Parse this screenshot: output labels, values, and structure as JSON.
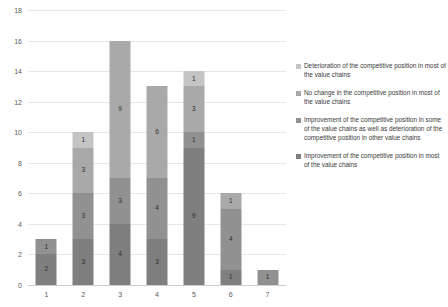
{
  "chart_data": {
    "type": "bar",
    "stacked": true,
    "title": "",
    "subtitle": "",
    "xlabel": "",
    "ylabel": "",
    "categories": [
      "1",
      "2",
      "3",
      "4",
      "5",
      "6",
      "7"
    ],
    "ylim": [
      0,
      18
    ],
    "ytick_values": [
      0,
      2,
      4,
      6,
      8,
      10,
      12,
      14,
      16,
      18
    ],
    "ytick_labels": [
      "0",
      "2",
      "4",
      "6",
      "8",
      "10",
      "12",
      "14",
      "16",
      "18"
    ],
    "grid": true,
    "grid_axis": "y",
    "legend_position": "right",
    "series": [
      {
        "name": "Improvement of the competitive position in most of the value chains",
        "color": "#7f7f7f",
        "values": [
          2,
          3,
          4,
          3,
          9,
          1,
          0
        ]
      },
      {
        "name": "Improvement of the competitive position in some of the value chains as well as deterioration of the competitive position in other value chains",
        "color": "#919191",
        "values": [
          1,
          3,
          3,
          4,
          1,
          4,
          1
        ]
      },
      {
        "name": "No change in the competitive position in most of the value chains",
        "color": "#a9a9a9",
        "values": [
          0,
          3,
          9,
          6,
          3,
          1,
          0
        ]
      },
      {
        "name": "Deterioration of the competitive position in most of the value chains",
        "color": "#c4c4c4",
        "values": [
          0,
          1,
          0,
          0,
          1,
          0,
          0
        ]
      }
    ],
    "column_totals": [
      3,
      10,
      16,
      13,
      14,
      6,
      1
    ],
    "bar_labels": {
      "1": [
        "2",
        "1"
      ],
      "2": [
        "3",
        "3",
        "3",
        "1"
      ],
      "3": [
        "4",
        "3",
        "9"
      ],
      "4": [
        "3",
        "4",
        "6"
      ],
      "5": [
        "9",
        "1",
        "3",
        "1"
      ],
      "6": [
        "1",
        "4",
        "1"
      ],
      "7": [
        "1"
      ]
    }
  },
  "legend": {
    "items": [
      {
        "label": "Deterioration of the competitive position in most of the value chains",
        "color": "#c4c4c4"
      },
      {
        "label": "No change in the competitive position in most of the value chains",
        "color": "#a9a9a9"
      },
      {
        "label": "Improvement of the competitive position in some of the value chains as well as deterioration of the competitive position in other value chains",
        "color": "#919191"
      },
      {
        "label": "Improvement of the competitive position in most of the value chains",
        "color": "#7f7f7f"
      }
    ]
  },
  "axis": {
    "gridline_color": "#e4e8ee",
    "baseline_color": "#c9ced6",
    "tick_text_color": "#5a5a5a"
  }
}
